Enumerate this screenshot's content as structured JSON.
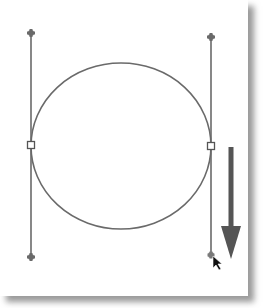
{
  "figure": {
    "colors": {
      "path": "#6a6a6a",
      "handle_line": "#6a6a6a",
      "anchor_fill": "#ffffff",
      "anchor_stroke": "#555555",
      "arrow": "#555555",
      "cursor": "#111111",
      "shadow": "#9a9a9a"
    },
    "ellipse": {
      "cx": 121,
      "cy": 146,
      "rx": 90,
      "ry": 83
    },
    "left_handle": {
      "x": 31,
      "top_y": 33,
      "bottom_y": 257,
      "anchor_y": 145
    },
    "right_handle": {
      "x": 211,
      "top_y": 37,
      "bottom_y": 255,
      "anchor_y": 146
    },
    "drag_arrow": {
      "x": 231,
      "start_y": 147,
      "end_y": 258,
      "direction": "down"
    },
    "cursor": {
      "x": 213,
      "y": 257,
      "icon": "pointer-arrow-icon"
    }
  }
}
